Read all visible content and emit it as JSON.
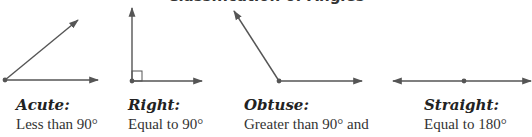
{
  "title": "Classification of Angles",
  "colors": {
    "line": "#555555",
    "text": "#222222"
  },
  "angles": [
    {
      "label": "Acute:",
      "description": "Less than 90°"
    },
    {
      "label": "Right:",
      "description": "Equal to 90°"
    },
    {
      "label": "Obtuse:",
      "description": "Greater than 90° and"
    },
    {
      "label": "Straight:",
      "description": "Equal to 180°"
    }
  ]
}
